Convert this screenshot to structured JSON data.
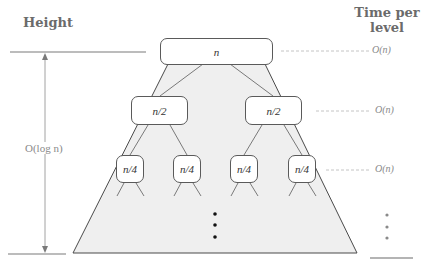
{
  "headers": {
    "height": "Height",
    "time_per_level_line1": "Time per",
    "time_per_level_line2": "level"
  },
  "tree": {
    "root": {
      "label": "n"
    },
    "level1": [
      {
        "label": "n/2"
      },
      {
        "label": "n/2"
      }
    ],
    "level2": [
      {
        "label": "n/4"
      },
      {
        "label": "n/4"
      },
      {
        "label": "n/4"
      },
      {
        "label": "n/4"
      }
    ]
  },
  "height_annotation": {
    "label": "O(log n)"
  },
  "time_per_level": [
    {
      "level": 0,
      "label": "O(n)"
    },
    {
      "level": 1,
      "label": "O(n)"
    },
    {
      "level": 2,
      "label": "O(n)"
    }
  ],
  "continuation": {
    "symbol": "vertical-ellipsis"
  },
  "colors": {
    "trapezoid_fill": "#efefef",
    "line": "#4a4a4a",
    "guide": "#7a7a7a",
    "dashed": "#b5b5b5",
    "header_text": "#6b6b6b",
    "muted_text": "#8a8a8a"
  }
}
